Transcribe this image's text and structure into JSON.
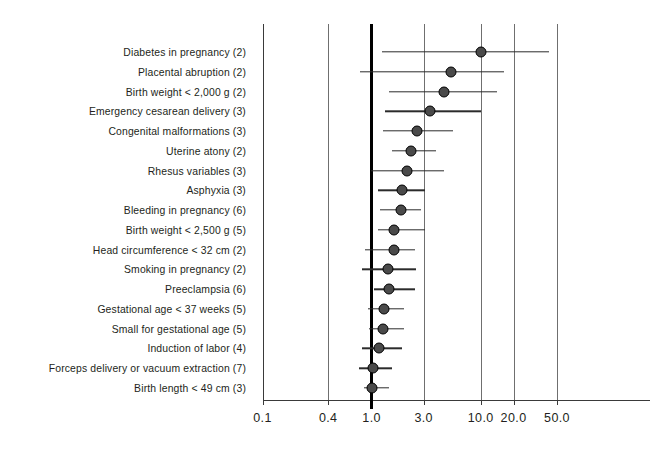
{
  "chart_data": {
    "type": "scatter",
    "subtype": "forest-plot",
    "title": "",
    "xlabel": "",
    "ylabel": "",
    "xscale": "log",
    "xlim": [
      0.1,
      50.0
    ],
    "null_value": 1.0,
    "grid": true,
    "legend": "none",
    "xticks": [
      0.1,
      0.4,
      1.0,
      3.0,
      10.0,
      20.0,
      50.0
    ],
    "xtick_labels": [
      "0.1",
      "0.4",
      "1.0",
      "3.0",
      "10.0",
      "20.0",
      "50.0"
    ],
    "categories": [
      "Diabetes in pregnancy (2)",
      "Placental abruption (2)",
      "Birth weight < 2,000 g (2)",
      "Emergency cesarean delivery (3)",
      "Congenital malformations (3)",
      "Uterine atony (2)",
      "Rhesus variables (3)",
      "Asphyxia (3)",
      "Bleeding in pregnancy (6)",
      "Birth weight < 2,500 g (5)",
      "Head circumference < 32 cm (2)",
      "Smoking in pregnancy (2)",
      "Preeclampsia (6)",
      "Gestational age < 37 weeks (5)",
      "Small for gestational age (5)",
      "Induction of labor (4)",
      "Forceps delivery or vacuum extraction (7)",
      "Birth length < 49 cm (3)"
    ],
    "points": [
      {
        "label": "Diabetes in pregnancy (2)",
        "estimate": 10.0,
        "ci_low": 1.25,
        "ci_high": 42.0
      },
      {
        "label": "Placental abruption (2)",
        "estimate": 5.3,
        "ci_low": 0.78,
        "ci_high": 16.5
      },
      {
        "label": "Birth weight < 2,000 g (2)",
        "estimate": 4.6,
        "ci_low": 1.45,
        "ci_high": 14.0
      },
      {
        "label": "Emergency cesarean delivery (3)",
        "estimate": 3.4,
        "ci_low": 1.34,
        "ci_high": 10.0
      },
      {
        "label": "Congenital malformations (3)",
        "estimate": 2.6,
        "ci_low": 1.28,
        "ci_high": 5.6
      },
      {
        "label": "Uterine atony (2)",
        "estimate": 2.3,
        "ci_low": 1.55,
        "ci_high": 3.9
      },
      {
        "label": "Rhesus variables (3)",
        "estimate": 2.1,
        "ci_low": 0.98,
        "ci_high": 4.6
      },
      {
        "label": "Asphyxia (3)",
        "estimate": 1.9,
        "ci_low": 1.15,
        "ci_high": 3.1
      },
      {
        "label": "Bleeding in pregnancy (6)",
        "estimate": 1.85,
        "ci_low": 1.2,
        "ci_high": 2.85
      },
      {
        "label": "Birth weight < 2,500 g (5)",
        "estimate": 1.6,
        "ci_low": 1.15,
        "ci_high": 3.1
      },
      {
        "label": "Head circumference < 32 cm (2)",
        "estimate": 1.62,
        "ci_low": 0.87,
        "ci_high": 2.5
      },
      {
        "label": "Smoking in pregnancy (2)",
        "estimate": 1.4,
        "ci_low": 0.82,
        "ci_high": 2.55
      },
      {
        "label": "Preeclampsia (6)",
        "estimate": 1.45,
        "ci_low": 1.05,
        "ci_high": 2.5
      },
      {
        "label": "Gestational age < 37 weeks (5)",
        "estimate": 1.3,
        "ci_low": 0.92,
        "ci_high": 2.0
      },
      {
        "label": "Small for gestational age (5)",
        "estimate": 1.28,
        "ci_low": 0.95,
        "ci_high": 2.0
      },
      {
        "label": "Induction of labor (4)",
        "estimate": 1.18,
        "ci_low": 0.81,
        "ci_high": 1.9
      },
      {
        "label": "Forceps delivery or vacuum extraction (7)",
        "estimate": 1.02,
        "ci_low": 0.76,
        "ci_high": 1.55
      },
      {
        "label": "Birth length < 49 cm (3)",
        "estimate": 1.0,
        "ci_low": 0.85,
        "ci_high": 1.45
      }
    ]
  },
  "style": {
    "marker_fill": "#4a4a4a",
    "marker_stroke": "#000000",
    "line_color": "#2b2b2b",
    "grid_color": "#6f6f6f",
    "null_line_color": "#000000",
    "text_color": "#231f20",
    "background": "#ffffff"
  }
}
